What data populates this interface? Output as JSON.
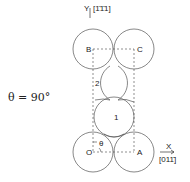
{
  "figure": {
    "theta_equation": "θ = 90°",
    "y_axis_label": "Y",
    "y_axis_direction": "[1̄1̄1]",
    "x_axis_label": "X",
    "x_axis_direction": "[011̄]",
    "points": {
      "B": "B",
      "C": "C",
      "O": "O",
      "A": "A",
      "site_1": "1",
      "site_2": "2",
      "angle": "θ"
    }
  }
}
